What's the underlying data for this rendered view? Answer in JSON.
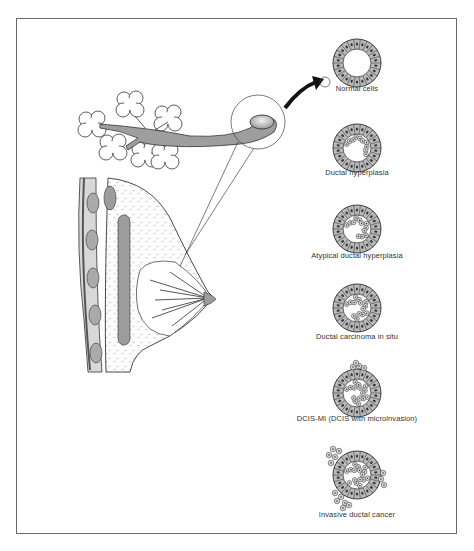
{
  "figure": {
    "stages": [
      {
        "label": "Normal cells",
        "cx": 357,
        "cy": 63,
        "type": "normal"
      },
      {
        "label": "Ductal hyperplasia",
        "cx": 357,
        "cy": 148,
        "type": "hyperplasia"
      },
      {
        "label": "Atypical ductal hyperplasia",
        "cx": 357,
        "cy": 229,
        "type": "atypical"
      },
      {
        "label": "Ductal carcinoma in situ",
        "cx": 357,
        "cy": 308,
        "type": "dcis"
      },
      {
        "label": "DCIS-MI (DCIS with microinvasion)",
        "cx": 357,
        "cy": 393,
        "type": "dcis-mi"
      },
      {
        "label": "Invasive ductal cancer",
        "cx": 357,
        "cy": 475,
        "type": "invasive"
      }
    ],
    "label_positions": [
      89,
      172,
      255,
      336,
      418,
      514
    ],
    "colors": {
      "ink": "#2a2a2a",
      "cell_fill": "#b9b9b9",
      "cell_light": "#d6d6d6",
      "duct_fill": "#9a9a9a",
      "border": "#6a6a6a"
    }
  }
}
